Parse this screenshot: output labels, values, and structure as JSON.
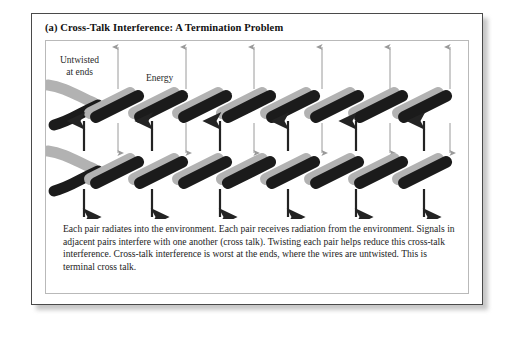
{
  "figure": {
    "title": "(a)  Cross-Talk Interference:  A Termination Problem",
    "labels": {
      "untwisted_line1": "Untwisted",
      "untwisted_line2": "at ends",
      "energy": "Energy"
    },
    "caption": "Each pair radiates into the environment.  Each pair receives radiation from the environment.  Signals in adjacent pairs interfere with one another (cross talk).  Twisting each pair helps reduce this cross-talk interference.  Cross-talk interference is worst at the ends, where the wires are untwisted.  This is terminal cross talk."
  },
  "colors": {
    "wire_dark": "#1b1b1b",
    "wire_light": "#b2b2b2",
    "arrow_dark": "#232323",
    "arrow_light": "#9a9a9a",
    "frame_outer": "#4a4a4a",
    "frame_inner": "#b9b9b9",
    "background": "#ffffff"
  },
  "diagram": {
    "type": "twisted-pair-crosstalk",
    "pairs": [
      {
        "name": "upper-pair",
        "y_center": 62,
        "untwisted_end": "left"
      },
      {
        "name": "lower-pair",
        "y_center": 128,
        "untwisted_end": "left"
      }
    ],
    "twist_segments": 7,
    "arrow_columns_x": [
      38,
      72,
      106,
      140,
      174,
      208,
      242,
      276,
      310,
      344,
      378
    ],
    "arrow_rows": [
      {
        "name": "top-radiation",
        "direction": "up",
        "weight": "thin",
        "color": "#9a9a9a"
      },
      {
        "name": "between-pairs-up",
        "direction": "up",
        "weight": "thick",
        "color": "#232323"
      },
      {
        "name": "between-pairs-down",
        "direction": "down",
        "weight": "thin",
        "color": "#9a9a9a"
      },
      {
        "name": "bottom-radiation",
        "direction": "down",
        "weight": "thick",
        "color": "#232323"
      }
    ]
  }
}
